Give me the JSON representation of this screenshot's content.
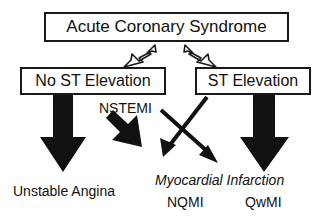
{
  "diagram": {
    "title_box": {
      "label": "Acute Coronary Syndrome"
    },
    "branch_boxes": [
      {
        "label": "No ST Elevation"
      },
      {
        "label": "ST Elevation"
      }
    ],
    "free_labels": {
      "nstemi": "NSTEMI",
      "unstable_angina": "Unstable Angina",
      "myocardial_infarction": "Myocardial Infarction",
      "nqmi": "NQMI",
      "qwmi": "QwMI"
    },
    "colors": {
      "stroke": "#1a1a1a",
      "fill": "#ffffff",
      "arrow_solid": "#111111",
      "text": "#111111"
    },
    "connectors": [
      {
        "name": "acs-to-no-st-elevation",
        "style": "hollow-outline",
        "direction": "down-left"
      },
      {
        "name": "acs-to-st-elevation",
        "style": "hollow-outline",
        "direction": "down-right"
      },
      {
        "name": "no-st-elevation-to-unstable-angina",
        "style": "solid-thick",
        "direction": "down"
      },
      {
        "name": "no-st-elevation-to-nqmi",
        "style": "solid-thick",
        "direction": "down-right"
      },
      {
        "name": "no-st-elevation-to-qwmi",
        "style": "solid-thin",
        "direction": "down-right"
      },
      {
        "name": "st-elevation-to-nqmi",
        "style": "solid-thin",
        "direction": "down-left"
      },
      {
        "name": "st-elevation-to-qwmi",
        "style": "solid-thick",
        "direction": "down"
      }
    ]
  }
}
